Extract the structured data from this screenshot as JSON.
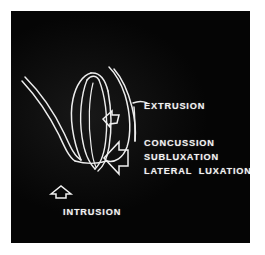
{
  "figure": {
    "panel_background": "#050505",
    "page_background": "#ffffff",
    "stroke_color": "#ededed"
  },
  "labels": {
    "extrusion": "EXTRUSION",
    "concussion": "CONCUSSION",
    "subluxation": "SUBLUXATION",
    "lateral_luxation": "LATERAL  LUXATION",
    "intrusion": "INTRUSION"
  },
  "arrows": [
    {
      "name": "extrusion-arrow",
      "direction": "up-left",
      "size": "small",
      "style": "outline"
    },
    {
      "name": "lateral-luxation-arrow",
      "direction": "left",
      "size": "large",
      "style": "outline"
    },
    {
      "name": "intrusion-arrow",
      "direction": "up",
      "size": "small",
      "style": "outline"
    }
  ],
  "illustration": {
    "name": "tooth-root-line-drawing",
    "description": "Line drawing outline of a tooth with root and surrounding alveolar bone contours",
    "style": "white outline on black"
  }
}
